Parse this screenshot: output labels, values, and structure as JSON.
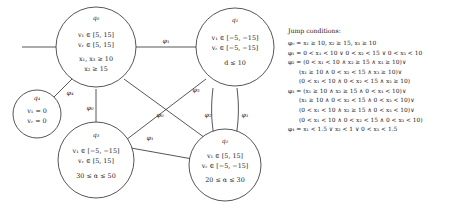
{
  "figure": {
    "kind": "hybrid-automaton-state-diagram",
    "nodes": [
      {
        "id": "q0",
        "label": "q₀",
        "lines": [
          "v₁ ∈ [5, 15]",
          "v᷊ᵣ ∈ [5, 15]",
          "x₁, x₃ ≥ 10",
          "x₂ ≥ 15"
        ],
        "line1": "v₁ ∈ [5, 15]",
        "line2": "vᵣ ∈ [5, 15]",
        "line3": "x₁, x₃ ≥ 10",
        "line4": "x₂ ≥ 15"
      },
      {
        "id": "q1",
        "label": "q₁",
        "line1": "v₁ ∈ [−5, −15]",
        "line2": "vᵣ ∈ [−5, −15]",
        "line3": "d ≤ 10"
      },
      {
        "id": "q2",
        "label": "q₂",
        "line1": "v₁ ∈ [5, 15]",
        "line2": "vᵣ ∈ [−5, −15]",
        "line3": "20 ≤ α ≤ 30"
      },
      {
        "id": "q3",
        "label": "q₃",
        "line1": "v₁ ∈ [−5, −15]",
        "line2": "vᵣ ∈ [5, 15]",
        "line3": "30 ≤ α ≤ 50"
      },
      {
        "id": "q4",
        "label": "q₄",
        "line1": "v₁ = 0",
        "line2": "vᵣ = 0"
      }
    ],
    "edge_labels": {
      "q0_q1": "φ₁",
      "q0_q4": "φ₄",
      "q0_q3": "φ₀",
      "q0_q2": "φ₁",
      "q1_q3": "φ₃",
      "q1_q2": "φ₁",
      "q2_q1": "φ₂",
      "q3_q2_cross": "φ₀"
    }
  },
  "legend": {
    "title": "Jump conditions:",
    "entries": [
      {
        "lines": [
          "φ₀ = x₁ ≥ 10, x₂ ≥ 15, x₃ ≥ 10"
        ]
      },
      {
        "lines": [
          "φ₁ = 0 < x₁ < 10 ∨ 0 < x₂ < 15 ∨ 0 < x₃ < 10"
        ]
      },
      {
        "lines": [
          "φ₂ = (0 < x₁ < 10 ∧ x₂ ≥ 15 ∧ x₃ ≥ 10)∨",
          "(x₁ ≥ 10 ∧ 0 < x₂ < 15 ∧ x₃ ≥ 10)∨",
          "(0 < x₁ < 10 ∧ 0 < x₂ < 15 ∧ x₃ ≥ 10)"
        ]
      },
      {
        "lines": [
          "φ₃ = (x₁ ≥ 10 ∧ x₂ ≥ 15 ∧ 0 < x₃ < 10)∨",
          "(x₁ ≥ 10 ∧ 0 < x₂ < 15 ∧ 0 < x₃ < 10)∨",
          "(0 < x₁ < 10 ∧ x₂ ≥ 15 ∧ 0 < x₃ < 10)∨",
          "(0 < x₁ < 10 ∧ 0 < x₂ < 15 ∧ 0 < x₃ < 10)"
        ]
      },
      {
        "lines": [
          "φ₄ = x₁ < 1.5 ∨ x₂ < 1 ∨ 0 < x₃ < 1.5"
        ]
      }
    ],
    "l0": "φ₀ = x₁ ≥ 10, x₂ ≥ 15, x₃ ≥ 10",
    "l1": "φ₁ = 0 < x₁ < 10 ∨ 0 < x₂ < 15 ∨ 0 < x₃ < 10",
    "l2a": "φ₂ = (0 < x₁ < 10 ∧ x₂ ≥ 15 ∧ x₃ ≥ 10)∨",
    "l2b": "(x₁ ≥ 10 ∧ 0 < x₂ < 15 ∧ x₃ ≥ 10)∨",
    "l2c": "(0 < x₁ < 10 ∧ 0 < x₂ < 15 ∧ x₃ ≥ 10)",
    "l3a": "φ₃ = (x₁ ≥ 10 ∧ x₂ ≥ 15 ∧ 0 < x₃ < 10)∨",
    "l3b": "(x₁ ≥ 10 ∧ 0 < x₂ < 15 ∧ 0 < x₃ < 10)∨",
    "l3c": "(0 < x₁ < 10 ∧ x₂ ≥ 15 ∧ 0 < x₃ < 10)∨",
    "l3d": "(0 < x₁ < 10 ∧ 0 < x₂ < 15 ∧ 0 < x₃ < 10)",
    "l4": "φ₄ = x₁ < 1.5 ∨ x₂ < 1 ∨ 0 < x₃ < 1.5"
  }
}
